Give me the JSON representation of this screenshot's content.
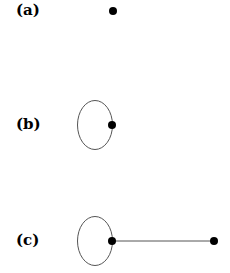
{
  "panels": [
    {
      "label": "(a)",
      "description": "single vertex"
    },
    {
      "label": "(b)",
      "description": "vertex with a loop"
    },
    {
      "label": "(c)",
      "description": "vertex with a loop joined by an edge to a second vertex"
    }
  ],
  "colors": {
    "stroke": "#555555",
    "vertex": "#000000",
    "background": "#ffffff"
  }
}
